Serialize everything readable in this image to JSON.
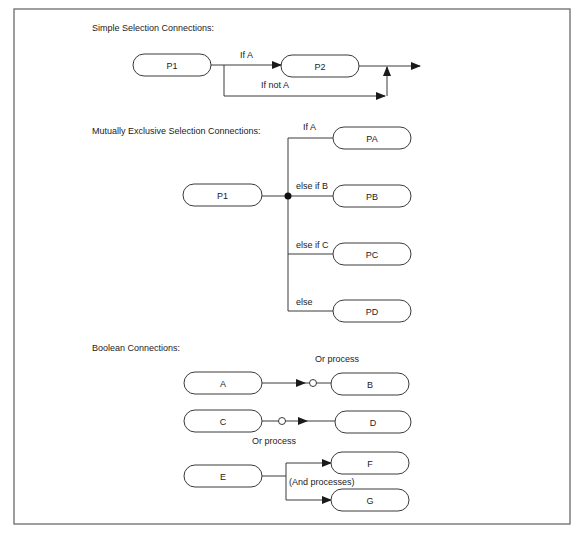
{
  "sections": {
    "simple": {
      "title": "Simple Selection Connections:",
      "boxes": {
        "p1": "P1",
        "p2": "P2"
      },
      "labels": {
        "if_a": "If A",
        "if_not_a": "If not A"
      }
    },
    "mutex": {
      "title": "Mutually Exclusive Selection Connections:",
      "boxes": {
        "p1": "P1",
        "pa": "PA",
        "pb": "PB",
        "pc": "PC",
        "pd": "PD"
      },
      "labels": {
        "if_a": "If A",
        "else_if_b": "else if B",
        "else_if_c": "else if C",
        "else": "else"
      }
    },
    "boolean": {
      "title": "Boolean Connections:",
      "boxes": {
        "a": "A",
        "b": "B",
        "c": "C",
        "d": "D",
        "e": "E",
        "f": "F",
        "g": "G"
      },
      "labels": {
        "or_process_1": "Or process",
        "or_process_2": "Or process",
        "and_processes": "(And processes)"
      }
    }
  },
  "colors": {
    "stroke": "#3a3a3a",
    "frame": "#6b6b6b",
    "text": "#222222"
  }
}
